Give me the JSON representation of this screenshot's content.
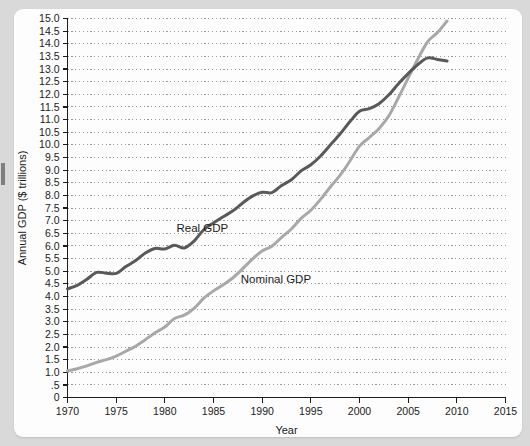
{
  "chart_data": {
    "type": "line",
    "title": "",
    "xlabel": "Year",
    "ylabel": "Annual GDP ($ trillions)",
    "xlim": [
      1970,
      2015
    ],
    "ylim": [
      0,
      15
    ],
    "grid": true,
    "grid_axis": "y",
    "legend_position": "inline-annotation",
    "xticks": [
      1970,
      1975,
      1980,
      1985,
      1990,
      1995,
      2000,
      2005,
      2010,
      2015
    ],
    "xtick_labels": [
      "1970",
      "1975",
      "1980",
      "1985",
      "1990",
      "1995",
      "2000",
      "2005",
      "2010",
      "2015"
    ],
    "yticks": [
      0,
      0.5,
      1.0,
      1.5,
      2.0,
      2.5,
      3.0,
      3.5,
      4.0,
      4.5,
      5.0,
      5.5,
      6.0,
      6.5,
      7.0,
      7.5,
      8.0,
      8.5,
      9.0,
      9.5,
      10.0,
      10.5,
      11.0,
      11.5,
      12.0,
      12.5,
      13.0,
      13.5,
      14.0,
      14.5,
      15.0
    ],
    "ytick_labels": [
      "0",
      ".5",
      "1.0",
      "1.5",
      "2.0",
      "2.5",
      "3.0",
      "3.5",
      "4.0",
      "4.5",
      "5.0",
      "5.5",
      "6.0",
      "6.5",
      "7.0",
      "7.5",
      "8.0",
      "8.5",
      "9.0",
      "9.5",
      "10.0",
      "10.5",
      "11.0",
      "11.5",
      "12.0",
      "12.5",
      "13.0",
      "13.5",
      "14.0",
      "14.5",
      "15.0"
    ],
    "x": [
      1970,
      1971,
      1972,
      1973,
      1974,
      1975,
      1976,
      1977,
      1978,
      1979,
      1980,
      1981,
      1982,
      1983,
      1984,
      1985,
      1986,
      1987,
      1988,
      1989,
      1990,
      1991,
      1992,
      1993,
      1994,
      1995,
      1996,
      1997,
      1998,
      1999,
      2000,
      2001,
      2002,
      2003,
      2004,
      2005,
      2006,
      2007,
      2008,
      2009
    ],
    "series": [
      {
        "name": "Real GDP",
        "color": "#595959",
        "annotation": "Real GDP",
        "values": [
          4.3,
          4.44,
          4.68,
          4.95,
          4.92,
          4.91,
          5.18,
          5.42,
          5.72,
          5.9,
          5.88,
          6.03,
          5.92,
          6.19,
          6.64,
          6.91,
          7.15,
          7.39,
          7.7,
          7.97,
          8.12,
          8.11,
          8.39,
          8.62,
          8.97,
          9.21,
          9.56,
          9.99,
          10.43,
          10.91,
          11.33,
          11.43,
          11.63,
          11.97,
          12.42,
          12.82,
          13.18,
          13.44,
          13.38,
          13.32
        ]
      },
      {
        "name": "Nominal GDP",
        "color": "#a8a8a8",
        "annotation": "Nominal GDP",
        "values": [
          1.05,
          1.14,
          1.25,
          1.39,
          1.5,
          1.64,
          1.83,
          2.03,
          2.29,
          2.56,
          2.79,
          3.13,
          3.26,
          3.53,
          3.93,
          4.22,
          4.46,
          4.74,
          5.1,
          5.48,
          5.8,
          5.99,
          6.34,
          6.67,
          7.09,
          7.41,
          7.84,
          8.33,
          8.79,
          9.35,
          9.95,
          10.29,
          10.64,
          11.14,
          11.87,
          12.64,
          13.4,
          14.08,
          14.44,
          14.9
        ]
      }
    ],
    "annotations": [
      {
        "text": "Real GDP",
        "x": 1981.2,
        "y": 6.55,
        "series": "Real GDP"
      },
      {
        "text": "Nominal GDP",
        "x": 1987.8,
        "y": 4.55,
        "series": "Nominal GDP"
      }
    ]
  }
}
